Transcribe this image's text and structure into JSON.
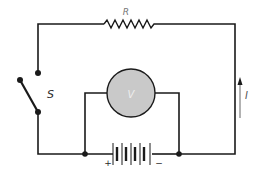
{
  "diagram": {
    "colors": {
      "wire": "#1a1a1a",
      "label": "#2a2a2a",
      "resistor_label": "#777777",
      "meter_fill": "#c9c9c9",
      "arrow": "#666666"
    },
    "labels": {
      "resistor": "R",
      "switch": "S",
      "voltmeter": "V",
      "current": "I",
      "battery_positive": "+",
      "battery_negative": "−"
    },
    "components": [
      {
        "id": "resistor",
        "type": "resistor",
        "label": "R"
      },
      {
        "id": "switch",
        "type": "switch",
        "state": "open",
        "label": "S"
      },
      {
        "id": "voltmeter",
        "type": "meter",
        "label": "V"
      },
      {
        "id": "battery",
        "type": "battery",
        "cells": 4
      },
      {
        "id": "current-arrow",
        "type": "arrow",
        "direction": "up",
        "label": "I"
      }
    ]
  }
}
